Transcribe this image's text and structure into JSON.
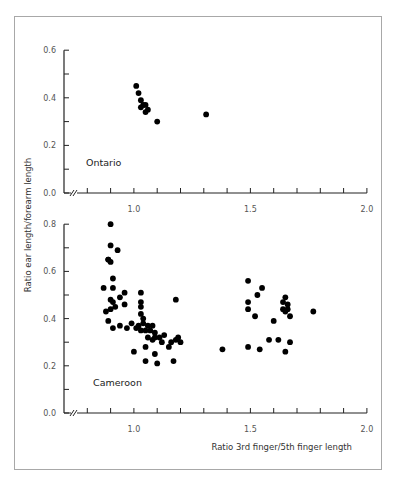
{
  "chart_data": [
    {
      "type": "scatter",
      "panel": "top",
      "label": "Ontario",
      "xlabel": "",
      "ylabel": "Ratio ear length/forearm length",
      "xlim": [
        0.7,
        2.0
      ],
      "ylim": [
        0.0,
        0.6
      ],
      "x_ticks": [
        "1.0",
        "1.5",
        "2.0"
      ],
      "y_ticks": [
        "0.0",
        "0.2",
        "0.4",
        "0.6"
      ],
      "axis_break": true,
      "grid": false,
      "points": [
        {
          "x": 1.01,
          "y": 0.45
        },
        {
          "x": 1.02,
          "y": 0.42
        },
        {
          "x": 1.03,
          "y": 0.39
        },
        {
          "x": 1.04,
          "y": 0.37
        },
        {
          "x": 1.03,
          "y": 0.36
        },
        {
          "x": 1.05,
          "y": 0.37
        },
        {
          "x": 1.05,
          "y": 0.34
        },
        {
          "x": 1.06,
          "y": 0.35
        },
        {
          "x": 1.1,
          "y": 0.3
        },
        {
          "x": 1.31,
          "y": 0.33
        }
      ]
    },
    {
      "type": "scatter",
      "panel": "bottom",
      "label": "Cameroon",
      "xlabel": "Ratio 3rd finger/5th finger length",
      "ylabel": "Ratio ear length/forearm length",
      "xlim": [
        0.7,
        2.0
      ],
      "ylim": [
        0.0,
        0.8
      ],
      "x_ticks": [
        "1.0",
        "1.5",
        "2.0"
      ],
      "y_ticks": [
        "0.0",
        "0.2",
        "0.4",
        "0.6",
        "0.8"
      ],
      "axis_break": true,
      "grid": false,
      "points": [
        {
          "x": 0.9,
          "y": 0.8
        },
        {
          "x": 0.9,
          "y": 0.71
        },
        {
          "x": 0.93,
          "y": 0.69
        },
        {
          "x": 0.89,
          "y": 0.65
        },
        {
          "x": 0.9,
          "y": 0.64
        },
        {
          "x": 0.89,
          "y": 0.65
        },
        {
          "x": 0.91,
          "y": 0.57
        },
        {
          "x": 0.91,
          "y": 0.53
        },
        {
          "x": 0.87,
          "y": 0.53
        },
        {
          "x": 0.94,
          "y": 0.49
        },
        {
          "x": 0.9,
          "y": 0.48
        },
        {
          "x": 0.91,
          "y": 0.47
        },
        {
          "x": 0.96,
          "y": 0.51
        },
        {
          "x": 0.9,
          "y": 0.44
        },
        {
          "x": 0.92,
          "y": 0.45
        },
        {
          "x": 0.96,
          "y": 0.46
        },
        {
          "x": 0.88,
          "y": 0.43
        },
        {
          "x": 0.89,
          "y": 0.39
        },
        {
          "x": 0.91,
          "y": 0.36
        },
        {
          "x": 0.94,
          "y": 0.37
        },
        {
          "x": 0.97,
          "y": 0.36
        },
        {
          "x": 1.03,
          "y": 0.51
        },
        {
          "x": 1.03,
          "y": 0.47
        },
        {
          "x": 1.03,
          "y": 0.45
        },
        {
          "x": 1.03,
          "y": 0.42
        },
        {
          "x": 1.04,
          "y": 0.4
        },
        {
          "x": 0.99,
          "y": 0.38
        },
        {
          "x": 1.01,
          "y": 0.36
        },
        {
          "x": 1.02,
          "y": 0.37
        },
        {
          "x": 1.04,
          "y": 0.38
        },
        {
          "x": 1.06,
          "y": 0.37
        },
        {
          "x": 1.08,
          "y": 0.37
        },
        {
          "x": 1.03,
          "y": 0.35
        },
        {
          "x": 1.05,
          "y": 0.35
        },
        {
          "x": 1.07,
          "y": 0.35
        },
        {
          "x": 1.09,
          "y": 0.34
        },
        {
          "x": 1.09,
          "y": 0.32
        },
        {
          "x": 1.06,
          "y": 0.32
        },
        {
          "x": 1.08,
          "y": 0.31
        },
        {
          "x": 1.11,
          "y": 0.32
        },
        {
          "x": 1.12,
          "y": 0.3
        },
        {
          "x": 1.13,
          "y": 0.33
        },
        {
          "x": 1.16,
          "y": 0.3
        },
        {
          "x": 1.18,
          "y": 0.31
        },
        {
          "x": 1.19,
          "y": 0.32
        },
        {
          "x": 1.2,
          "y": 0.3
        },
        {
          "x": 1.15,
          "y": 0.28
        },
        {
          "x": 1.09,
          "y": 0.25
        },
        {
          "x": 1.05,
          "y": 0.28
        },
        {
          "x": 1.0,
          "y": 0.26
        },
        {
          "x": 1.05,
          "y": 0.22
        },
        {
          "x": 1.1,
          "y": 0.21
        },
        {
          "x": 1.17,
          "y": 0.22
        },
        {
          "x": 1.18,
          "y": 0.48
        },
        {
          "x": 1.49,
          "y": 0.56
        },
        {
          "x": 1.55,
          "y": 0.53
        },
        {
          "x": 1.53,
          "y": 0.5
        },
        {
          "x": 1.49,
          "y": 0.47
        },
        {
          "x": 1.49,
          "y": 0.44
        },
        {
          "x": 1.52,
          "y": 0.41
        },
        {
          "x": 1.6,
          "y": 0.39
        },
        {
          "x": 1.65,
          "y": 0.49
        },
        {
          "x": 1.64,
          "y": 0.47
        },
        {
          "x": 1.66,
          "y": 0.46
        },
        {
          "x": 1.64,
          "y": 0.44
        },
        {
          "x": 1.66,
          "y": 0.44
        },
        {
          "x": 1.65,
          "y": 0.43
        },
        {
          "x": 1.67,
          "y": 0.41
        },
        {
          "x": 1.77,
          "y": 0.43
        },
        {
          "x": 1.58,
          "y": 0.31
        },
        {
          "x": 1.62,
          "y": 0.31
        },
        {
          "x": 1.67,
          "y": 0.3
        },
        {
          "x": 1.49,
          "y": 0.28
        },
        {
          "x": 1.54,
          "y": 0.27
        },
        {
          "x": 1.65,
          "y": 0.26
        },
        {
          "x": 1.38,
          "y": 0.27
        }
      ]
    }
  ],
  "labels": {
    "top_panel": "Ontario",
    "bottom_panel": "Cameroon",
    "y_axis_title": "Ratio ear length/forearm length",
    "x_axis_title": "Ratio 3rd finger/5th finger length",
    "top_y_ticks": [
      "0.6",
      "0.4",
      "0.2",
      "0.0"
    ],
    "bottom_y_ticks": [
      "0.8",
      "0.6",
      "0.4",
      "0.2",
      "0.0"
    ],
    "x_ticks": [
      "1.0",
      "1.5",
      "2.0"
    ]
  },
  "colors": {
    "points": "#000000",
    "axis": "#222222",
    "frame": "#a8a8a8",
    "tick_text": "#555555"
  }
}
